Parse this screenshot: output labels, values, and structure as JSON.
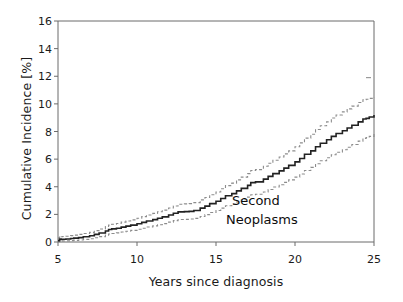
{
  "chart_data": {
    "type": "line",
    "title": "",
    "subtitle": "",
    "xlabel": "Years since diagnosis",
    "ylabel": "Cumulative Incidence [%]",
    "xlim": [
      5,
      25
    ],
    "ylim": [
      0,
      16
    ],
    "xticks": [
      5,
      10,
      15,
      20,
      25
    ],
    "yticks": [
      0,
      2,
      4,
      6,
      8,
      10,
      12,
      14,
      16
    ],
    "grid": false,
    "legend_position": "none",
    "annotations": [
      {
        "text": "Second",
        "x": 19.0,
        "y": 2.3
      },
      {
        "text": "Neoplasms",
        "x": 18.6,
        "y": 1.5
      }
    ],
    "step_interpolation": true,
    "series": [
      {
        "name": "Cumulative incidence",
        "style": "solid",
        "color": "#222222",
        "x": [
          5.0,
          5.1,
          5.2,
          5.3,
          5.5,
          5.8,
          6.0,
          6.3,
          6.6,
          7.0,
          7.3,
          7.6,
          8.0,
          8.2,
          8.4,
          8.7,
          9.0,
          9.3,
          9.6,
          10.0,
          10.3,
          10.6,
          11.0,
          11.3,
          11.6,
          12.0,
          12.3,
          12.6,
          13.0,
          13.3,
          13.6,
          14.0,
          14.3,
          14.6,
          15.0,
          15.3,
          15.6,
          16.0,
          16.3,
          16.6,
          17.0,
          17.2,
          17.5,
          18.0,
          18.3,
          18.6,
          19.0,
          19.3,
          19.6,
          20.0,
          20.3,
          20.6,
          21.0,
          21.3,
          21.6,
          22.0,
          22.3,
          22.6,
          23.0,
          23.3,
          23.6,
          24.0,
          24.3,
          24.5,
          24.7,
          25.0
        ],
        "y": [
          0.1,
          0.22,
          0.18,
          0.2,
          0.22,
          0.25,
          0.28,
          0.32,
          0.38,
          0.45,
          0.55,
          0.65,
          0.8,
          0.9,
          0.95,
          1.0,
          1.08,
          1.15,
          1.22,
          1.32,
          1.42,
          1.52,
          1.62,
          1.72,
          1.82,
          1.95,
          2.08,
          2.18,
          2.2,
          2.22,
          2.28,
          2.45,
          2.6,
          2.78,
          2.95,
          3.15,
          3.35,
          3.5,
          3.7,
          3.88,
          4.1,
          4.3,
          4.35,
          4.55,
          4.75,
          4.95,
          5.15,
          5.35,
          5.55,
          5.8,
          6.05,
          6.35,
          6.6,
          6.9,
          7.15,
          7.4,
          7.65,
          7.85,
          8.05,
          8.25,
          8.45,
          8.7,
          8.9,
          8.95,
          9.05,
          9.2
        ]
      },
      {
        "name": "95% CI upper",
        "style": "dashed",
        "color": "#8c8c8c",
        "x": [
          5.0,
          5.1,
          5.2,
          5.3,
          5.5,
          5.8,
          6.0,
          6.3,
          6.6,
          7.0,
          7.3,
          7.6,
          8.0,
          8.2,
          8.4,
          8.7,
          9.0,
          9.3,
          9.6,
          10.0,
          10.3,
          10.6,
          11.0,
          11.3,
          11.6,
          12.0,
          12.3,
          12.6,
          13.0,
          13.3,
          13.6,
          14.0,
          14.3,
          14.6,
          15.0,
          15.3,
          15.6,
          16.0,
          16.3,
          16.6,
          17.0,
          17.2,
          17.5,
          18.0,
          18.3,
          18.6,
          19.0,
          19.3,
          19.6,
          20.0,
          20.3,
          20.6,
          21.0,
          21.3,
          21.6,
          22.0,
          22.3,
          22.6,
          23.0,
          23.3,
          23.6,
          24.0,
          24.3,
          24.5,
          24.7,
          25.0
        ],
        "y": [
          0.3,
          0.42,
          0.38,
          0.4,
          0.42,
          0.46,
          0.5,
          0.55,
          0.62,
          0.7,
          0.82,
          0.94,
          1.12,
          1.22,
          1.28,
          1.34,
          1.44,
          1.52,
          1.6,
          1.72,
          1.84,
          1.95,
          2.07,
          2.19,
          2.31,
          2.46,
          2.61,
          2.73,
          2.76,
          2.78,
          2.85,
          3.05,
          3.22,
          3.42,
          3.62,
          3.85,
          4.08,
          4.26,
          4.5,
          4.7,
          4.95,
          5.18,
          5.24,
          5.48,
          5.7,
          5.92,
          6.15,
          6.38,
          6.6,
          6.9,
          7.18,
          7.52,
          7.8,
          8.14,
          8.42,
          8.7,
          8.98,
          9.2,
          9.42,
          9.64,
          9.84,
          10.1,
          10.3,
          10.34,
          10.4,
          10.5
        ]
      },
      {
        "name": "95% CI lower",
        "style": "dashed",
        "color": "#8c8c8c",
        "x": [
          5.0,
          5.1,
          5.2,
          5.3,
          5.5,
          5.8,
          6.0,
          6.3,
          6.6,
          7.0,
          7.3,
          7.6,
          8.0,
          8.2,
          8.4,
          8.7,
          9.0,
          9.3,
          9.6,
          10.0,
          10.3,
          10.6,
          11.0,
          11.3,
          11.6,
          12.0,
          12.3,
          12.6,
          13.0,
          13.3,
          13.6,
          14.0,
          14.3,
          14.6,
          15.0,
          15.3,
          15.6,
          16.0,
          16.3,
          16.6,
          17.0,
          17.2,
          17.5,
          18.0,
          18.3,
          18.6,
          19.0,
          19.3,
          19.6,
          20.0,
          20.3,
          20.6,
          21.0,
          21.3,
          21.6,
          22.0,
          22.3,
          22.6,
          23.0,
          23.3,
          23.6,
          24.0,
          24.3,
          24.5,
          24.7,
          25.0
        ],
        "y": [
          0.02,
          0.08,
          0.06,
          0.07,
          0.08,
          0.1,
          0.12,
          0.15,
          0.19,
          0.24,
          0.31,
          0.39,
          0.5,
          0.58,
          0.62,
          0.66,
          0.72,
          0.78,
          0.84,
          0.92,
          1.0,
          1.09,
          1.17,
          1.25,
          1.33,
          1.44,
          1.55,
          1.63,
          1.64,
          1.66,
          1.71,
          1.85,
          1.98,
          2.14,
          2.28,
          2.45,
          2.62,
          2.74,
          2.9,
          3.06,
          3.25,
          3.42,
          3.46,
          3.62,
          3.8,
          3.98,
          4.15,
          4.32,
          4.5,
          4.7,
          4.92,
          5.18,
          5.4,
          5.66,
          5.88,
          6.1,
          6.32,
          6.5,
          6.68,
          6.86,
          7.06,
          7.3,
          7.5,
          7.56,
          7.65,
          7.9
        ]
      }
    ]
  },
  "axis": {
    "x_label": "Years since diagnosis",
    "y_label": "Cumulative Incidence [%]",
    "x_tick_labels": [
      "5",
      "10",
      "15",
      "20",
      "25"
    ],
    "y_tick_labels": [
      "0",
      "2",
      "4",
      "6",
      "8",
      "10",
      "12",
      "14",
      "16"
    ]
  },
  "annotation": {
    "line1": "Second",
    "line2": "Neoplasms"
  },
  "colors": {
    "curve": "#222222",
    "ci_band": "#8c8c8c",
    "axis": "#555555",
    "background": "#ffffff",
    "text": "#1a1a1a"
  }
}
